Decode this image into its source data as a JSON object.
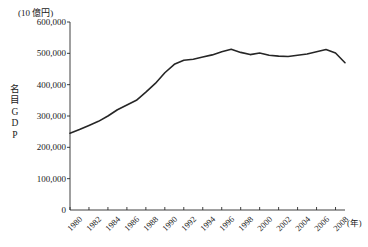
{
  "figure": {
    "unit_label": "(10 億円)",
    "y_axis_title": "名目GDP",
    "x_axis_unit": "(年)"
  },
  "chart_data": {
    "type": "line",
    "title": "",
    "subtitle": "",
    "xlabel": "(年)",
    "ylabel": "名目GDP",
    "yunit": "(10 億円)",
    "grid": false,
    "legend": "none",
    "xlim": [
      1980,
      2009
    ],
    "ylim": [
      0,
      600000
    ],
    "ytick_labels": [
      "600,000",
      "500,000",
      "400,000",
      "300,000",
      "200,000",
      "100,000",
      "0"
    ],
    "ytick_values": [
      600000,
      500000,
      400000,
      300000,
      200000,
      100000,
      0
    ],
    "xtick_labels": [
      "1980",
      "1982",
      "1984",
      "1986",
      "1988",
      "1990",
      "1992",
      "1994",
      "1996",
      "1998",
      "2000",
      "2002",
      "2004",
      "2006",
      "2008"
    ],
    "xtick_values": [
      1980,
      1982,
      1984,
      1986,
      1988,
      1990,
      1992,
      1994,
      1996,
      1998,
      2000,
      2002,
      2004,
      2006,
      2008
    ],
    "x": [
      1980,
      1981,
      1982,
      1983,
      1984,
      1985,
      1986,
      1987,
      1988,
      1989,
      1990,
      1991,
      1992,
      1993,
      1994,
      1995,
      1996,
      1997,
      1998,
      1999,
      2000,
      2001,
      2002,
      2003,
      2004,
      2005,
      2006,
      2007,
      2008,
      2009
    ],
    "values": [
      245000,
      257000,
      270000,
      283000,
      300000,
      320000,
      335000,
      350000,
      376000,
      404000,
      438000,
      465000,
      478000,
      481000,
      488000,
      495000,
      505000,
      513000,
      503000,
      496000,
      501000,
      494000,
      491000,
      490000,
      494000,
      498000,
      505000,
      512000,
      501000,
      470000
    ],
    "annotations": []
  }
}
